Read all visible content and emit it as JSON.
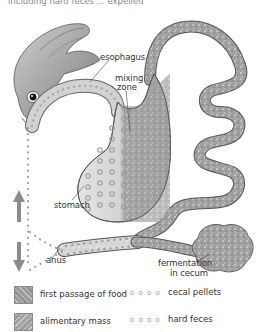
{
  "caption_fragment": "including hard feces ... expelled",
  "labels": {
    "esophagus": "esophagus",
    "mixing_zone_1": "mixing",
    "mixing_zone_2": "zone",
    "stomach": "stomach",
    "anus": "anus",
    "fermentation_1": "fermentation",
    "fermentation_2": "in cecum"
  },
  "legend": [
    {
      "symbol": "mottled-gray-swatch",
      "label": "first passage of food"
    },
    {
      "symbol": "dotted-gray-swatch",
      "label": "alimentary mass"
    },
    {
      "symbol": "o o o o",
      "label": "cecal pellets"
    },
    {
      "symbol": "o o o o",
      "label": "hard feces"
    }
  ],
  "colors": {
    "tract_fill": "#9a9a9a",
    "tract_light": "#d6d6d6",
    "outline": "#555555",
    "pellet": "#a0a0a0",
    "arrow": "#8c8c8c",
    "text": "#333333"
  }
}
